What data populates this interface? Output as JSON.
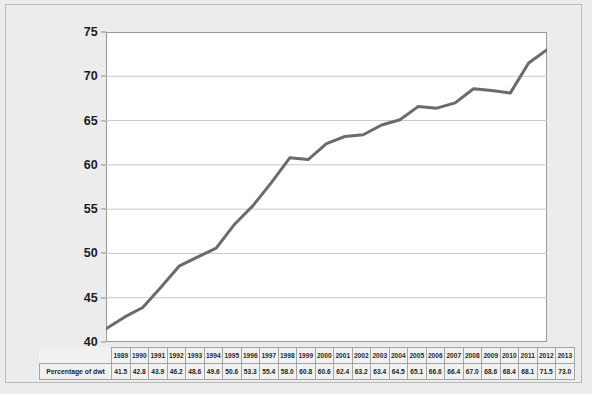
{
  "chart_data": {
    "type": "line",
    "title": "",
    "subtitle": "",
    "xlabel": "",
    "ylabel": "",
    "series_name": "Percentage of dwt",
    "categories": [
      "1989",
      "1990",
      "1991",
      "1992",
      "1993",
      "1994",
      "1995",
      "1996",
      "1997",
      "1998",
      "1999",
      "2000",
      "2001",
      "2002",
      "2003",
      "2004",
      "2005",
      "2006",
      "2007",
      "2008",
      "2009",
      "2010",
      "2011",
      "2012",
      "2013"
    ],
    "values": [
      41.5,
      42.8,
      43.9,
      46.2,
      48.6,
      49.6,
      50.6,
      53.3,
      55.4,
      58.0,
      60.8,
      60.6,
      62.4,
      63.2,
      63.4,
      64.5,
      65.1,
      66.6,
      66.4,
      67.0,
      68.6,
      68.4,
      68.1,
      71.5,
      73.0
    ],
    "ylim": [
      40,
      75
    ],
    "xlim": [
      1989,
      2013
    ],
    "y_ticks": [
      40,
      45,
      50,
      55,
      60,
      65,
      70,
      75
    ],
    "y_tick_labels": [
      "40",
      "45",
      "50",
      "55",
      "60",
      "65",
      "70",
      "75"
    ],
    "grid": true,
    "grid_axis": "y",
    "legend": false,
    "legend_position": "none",
    "line_color": "#6b6b6b",
    "line_width": 3,
    "markers": false,
    "plot_background": "#ffffff",
    "figure_background": "#ececec"
  },
  "table": {
    "row_label": "Percentage of dwt",
    "years": [
      "1989",
      "1990",
      "1991",
      "1992",
      "1993",
      "1994",
      "1995",
      "1996",
      "1997",
      "1998",
      "1999",
      "2000",
      "2001",
      "2002",
      "2003",
      "2004",
      "2005",
      "2006",
      "2007",
      "2008",
      "2009",
      "2010",
      "2011",
      "2012",
      "2013"
    ],
    "values": [
      "41.5",
      "42.8",
      "43.9",
      "46.2",
      "48.6",
      "49.6",
      "50.6",
      "53.3",
      "55.4",
      "58.0",
      "60.8",
      "60.6",
      "62.4",
      "63.2",
      "63.4",
      "64.5",
      "65.1",
      "66.6",
      "66.4",
      "67.0",
      "68.6",
      "68.4",
      "68.1",
      "71.5",
      "73.0"
    ]
  }
}
